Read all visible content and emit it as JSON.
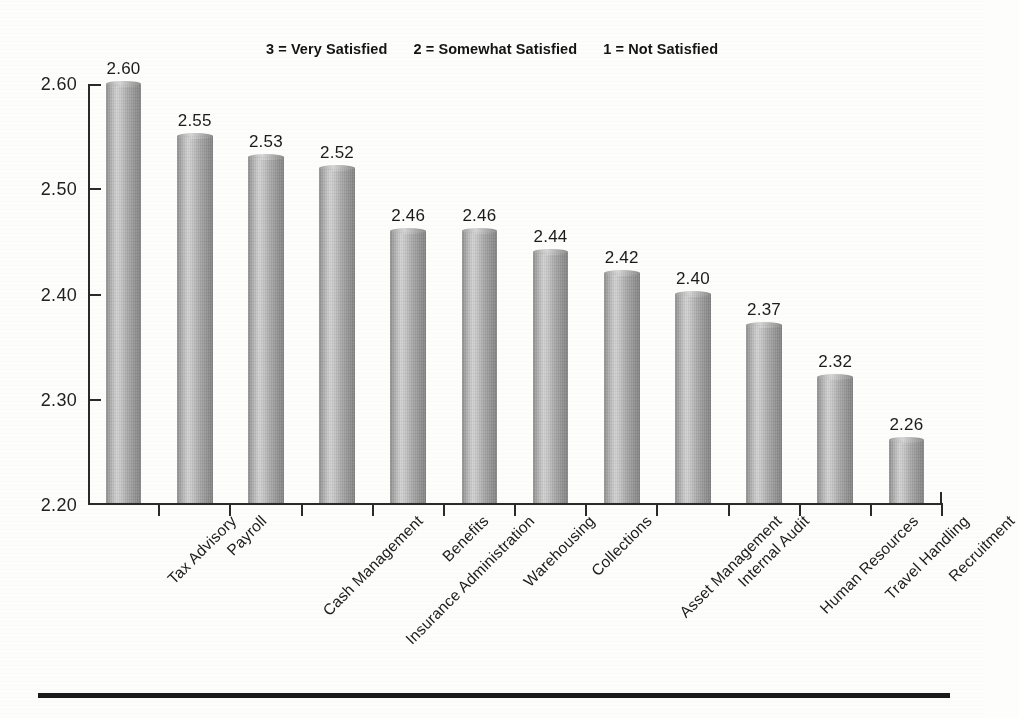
{
  "title_partial": "Figure 6. Respondent Satisfaction by Service",
  "subtitle": {
    "part1": "3 = Very Satisfied",
    "part2": "2 = Somewhat Satisfied",
    "part3": "1 = Not Satisfied"
  },
  "axis": {
    "y_ticks": [
      "2.60",
      "2.50",
      "2.40",
      "2.30",
      "2.20"
    ]
  },
  "chart_data": {
    "type": "bar",
    "title": "Figure 6. Respondent Satisfaction by Service",
    "subtitle": "3 = Very Satisfied    2 = Somewhat Satisfied    1 = Not Satisfied",
    "xlabel": "",
    "ylabel": "",
    "ylim": [
      2.2,
      2.6
    ],
    "ytick_step": 0.1,
    "ytick_labels": [
      "2.20",
      "2.30",
      "2.40",
      "2.50",
      "2.60"
    ],
    "grid": false,
    "legend": "none",
    "bar_style": "3d-cylinder-grayscale",
    "data_labels": true,
    "categories": [
      "Tax Advisory",
      "Payroll",
      "Cash Management",
      "Insurance Administration",
      "Benefits",
      "Warehousing",
      "Collections",
      "Asset Management",
      "Internal Audit",
      "Human Resources",
      "Travel Handling",
      "Recruitment"
    ],
    "values": [
      2.6,
      2.55,
      2.53,
      2.52,
      2.46,
      2.46,
      2.44,
      2.42,
      2.4,
      2.37,
      2.32,
      2.26
    ],
    "value_labels": [
      "2.60",
      "2.55",
      "2.53",
      "2.52",
      "2.46",
      "2.46",
      "2.44",
      "2.42",
      "2.40",
      "2.37",
      "2.32",
      "2.26"
    ]
  },
  "colors": {
    "bar_light": "#d2d2d2",
    "bar_mid": "#ababab",
    "bar_dark": "#838383",
    "axis": "#2a2a2a",
    "text": "#1a1a1a",
    "background": "#fdfdfb"
  }
}
